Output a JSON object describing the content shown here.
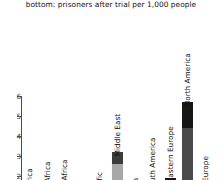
{
  "title": {
    "line1": "top: prisoners before trial per 1,000 people",
    "line2": "bottom: prisoners after trial per 1,000 people"
  },
  "axis": {
    "y_ticks": [
      "6",
      "5",
      "4",
      "3",
      "2"
    ],
    "y_tick_values": [
      6,
      5,
      4,
      3,
      2
    ]
  },
  "chart_data": {
    "type": "bar",
    "title": "bottom: prisoners after trial per 1,000 people",
    "subtitle": "top: prisoners before trial per 1,000 people",
    "xlabel": "",
    "ylabel": "",
    "ylim": [
      0,
      6.4
    ],
    "grid": false,
    "legend": "none",
    "stacked": true,
    "orientation": "vertical",
    "categories": [
      "Central Africa",
      "E. and S. Africa",
      "Northern Africa",
      "Asia",
      "Asia-Pacific",
      "Middle East",
      "East Asia",
      "South America",
      "Eastern Europe",
      "North America",
      "Western Europe"
    ],
    "series": [
      {
        "name": "prisoners after trial per 1,000 people",
        "color": "#4a4a4a",
        "values": [
          0.05,
          0.1,
          0.15,
          0.2,
          0.25,
          2.6,
          0.3,
          1.1,
          1.6,
          4.4,
          0.2
        ]
      },
      {
        "name": "prisoners before trial per 1,000 people",
        "color": "#161616",
        "values": [
          0.03,
          0.05,
          0.08,
          0.1,
          0.12,
          0.6,
          0.15,
          0.35,
          0.3,
          1.3,
          0.1
        ]
      }
    ],
    "totals": [
      0.08,
      0.15,
      0.23,
      0.3,
      0.37,
      3.2,
      0.45,
      1.45,
      1.9,
      5.7,
      0.3
    ]
  },
  "colors": {
    "segment_top": "#161616",
    "segment_bottom": "#4a4a4a",
    "segment_bottom_light": "#a8a8a8",
    "axis": "#4d4d4d",
    "text": "#111111",
    "background": "#ffffff"
  }
}
